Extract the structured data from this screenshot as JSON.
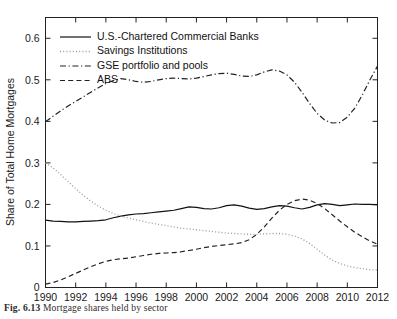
{
  "figure": {
    "caption_label": "Fig. 6.13",
    "caption_text": "Mortgage shares held by sector"
  },
  "chart_data": {
    "type": "line",
    "title": "",
    "subtitle": "",
    "xlabel": "",
    "ylabel": "Share of Total Home Mortgages",
    "xlim": [
      1990,
      2012
    ],
    "ylim": [
      0,
      0.65
    ],
    "grid": false,
    "legend_position": "top-left",
    "x_ticks": [
      1990,
      1992,
      1994,
      1996,
      1998,
      2000,
      2002,
      2004,
      2006,
      2008,
      2010,
      2012
    ],
    "x_tick_labels": [
      "1990",
      "1992",
      "1994",
      "1996",
      "1998",
      "2000",
      "2002",
      "2004",
      "2006",
      "2008",
      "2010",
      "2012"
    ],
    "y_ticks": [
      0,
      0.1,
      0.2,
      0.3,
      0.4,
      0.5,
      0.6
    ],
    "y_tick_labels": [
      "0",
      "0.1",
      "0.2",
      "0.3",
      "0.4",
      "0.5",
      "0.6"
    ],
    "x": [
      1990,
      1990.5,
      1991,
      1991.5,
      1992,
      1992.5,
      1993,
      1993.5,
      1994,
      1994.5,
      1995,
      1995.5,
      1996,
      1996.5,
      1997,
      1997.5,
      1998,
      1998.5,
      1999,
      1999.5,
      2000,
      2000.5,
      2001,
      2001.5,
      2002,
      2002.5,
      2003,
      2003.5,
      2004,
      2004.5,
      2005,
      2005.5,
      2006,
      2006.5,
      2007,
      2007.5,
      2008,
      2008.5,
      2009,
      2009.5,
      2010,
      2010.5,
      2011,
      2011.5,
      2012
    ],
    "series": [
      {
        "name": "U.S.-Chartered Commercial Banks",
        "style": "solid",
        "color": "#111111",
        "values": [
          0.162,
          0.16,
          0.159,
          0.158,
          0.158,
          0.159,
          0.16,
          0.161,
          0.163,
          0.168,
          0.172,
          0.175,
          0.177,
          0.178,
          0.18,
          0.182,
          0.184,
          0.186,
          0.19,
          0.194,
          0.193,
          0.19,
          0.189,
          0.192,
          0.197,
          0.199,
          0.196,
          0.191,
          0.188,
          0.19,
          0.194,
          0.197,
          0.196,
          0.192,
          0.189,
          0.193,
          0.199,
          0.202,
          0.2,
          0.197,
          0.199,
          0.201,
          0.2,
          0.2,
          0.199
        ]
      },
      {
        "name": "Savings Institutions",
        "style": "dotted",
        "color": "#9a9a9a",
        "values": [
          0.3,
          0.288,
          0.272,
          0.255,
          0.238,
          0.222,
          0.208,
          0.196,
          0.186,
          0.178,
          0.172,
          0.167,
          0.163,
          0.159,
          0.155,
          0.152,
          0.149,
          0.146,
          0.143,
          0.141,
          0.139,
          0.137,
          0.135,
          0.133,
          0.131,
          0.13,
          0.129,
          0.128,
          0.128,
          0.129,
          0.13,
          0.13,
          0.128,
          0.124,
          0.117,
          0.106,
          0.092,
          0.078,
          0.066,
          0.058,
          0.052,
          0.048,
          0.045,
          0.043,
          0.042
        ]
      },
      {
        "name": "GSE portfolio and pools",
        "style": "dashdot",
        "color": "#222222",
        "values": [
          0.399,
          0.412,
          0.425,
          0.437,
          0.448,
          0.459,
          0.47,
          0.481,
          0.491,
          0.498,
          0.503,
          0.5,
          0.496,
          0.494,
          0.496,
          0.5,
          0.503,
          0.504,
          0.503,
          0.502,
          0.504,
          0.508,
          0.512,
          0.515,
          0.516,
          0.513,
          0.509,
          0.508,
          0.512,
          0.519,
          0.524,
          0.521,
          0.512,
          0.494,
          0.47,
          0.443,
          0.419,
          0.403,
          0.396,
          0.397,
          0.41,
          0.432,
          0.464,
          0.5,
          0.533
        ]
      },
      {
        "name": "ABS",
        "style": "dashed",
        "color": "#222222",
        "values": [
          0.008,
          0.012,
          0.018,
          0.026,
          0.034,
          0.042,
          0.05,
          0.057,
          0.063,
          0.067,
          0.069,
          0.071,
          0.074,
          0.077,
          0.08,
          0.082,
          0.083,
          0.084,
          0.086,
          0.089,
          0.092,
          0.096,
          0.099,
          0.101,
          0.103,
          0.105,
          0.108,
          0.115,
          0.128,
          0.146,
          0.167,
          0.186,
          0.2,
          0.209,
          0.213,
          0.21,
          0.202,
          0.19,
          0.175,
          0.16,
          0.146,
          0.133,
          0.122,
          0.112,
          0.104
        ]
      }
    ]
  },
  "legend": {
    "entries": [
      {
        "label": "U.S.-Chartered Commercial Banks",
        "style": "solid"
      },
      {
        "label": "Savings Institutions",
        "style": "dotted"
      },
      {
        "label": "GSE portfolio and pools",
        "style": "dashdot"
      },
      {
        "label": "ABS",
        "style": "dashed"
      }
    ]
  }
}
